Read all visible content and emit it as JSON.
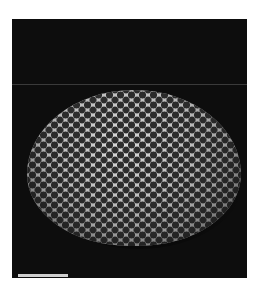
{
  "image": {
    "type": "sem-micrograph",
    "subject": "perforated dome-shaped microfossil (diatom/radiolarian-like test)",
    "background_color": "#0d0d0d",
    "specimen_color": "#bdbdbd",
    "pore_color": "#1b1b1b",
    "scale_bar": {
      "color": "#cfcfcf",
      "label": ""
    }
  }
}
